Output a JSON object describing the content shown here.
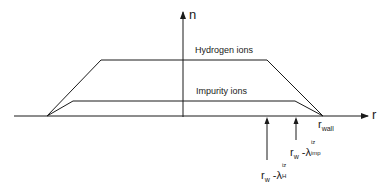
{
  "diagram": {
    "type": "density-profile",
    "axes": {
      "y_label": "n",
      "x_label": "r"
    },
    "curves": [
      {
        "name": "Hydrogen ions",
        "label": "Hydrogen ions",
        "shape": "trapezoid",
        "points": [
          [
            47,
            116
          ],
          [
            101,
            60
          ],
          [
            267,
            60
          ],
          [
            323,
            116
          ]
        ]
      },
      {
        "name": "Impurity ions",
        "label": "Impurity ions",
        "shape": "trapezoid",
        "points": [
          [
            47,
            116
          ],
          [
            73,
            101
          ],
          [
            295,
            101
          ],
          [
            323,
            116
          ]
        ]
      }
    ],
    "markers": {
      "wall": {
        "label_main": "r",
        "label_sub": "wall"
      },
      "imp": {
        "label_main": "r",
        "label_sub_w": "w",
        "dash": "-",
        "lambda": "λ",
        "sup": "iz",
        "sub": "imp"
      },
      "h": {
        "label_main": "r",
        "label_sub_w": "w",
        "dash": "-",
        "lambda": "λ",
        "sup": "iz",
        "sub": "H"
      }
    },
    "colors": {
      "line": "#1a1a1a",
      "background": "#ffffff"
    }
  }
}
